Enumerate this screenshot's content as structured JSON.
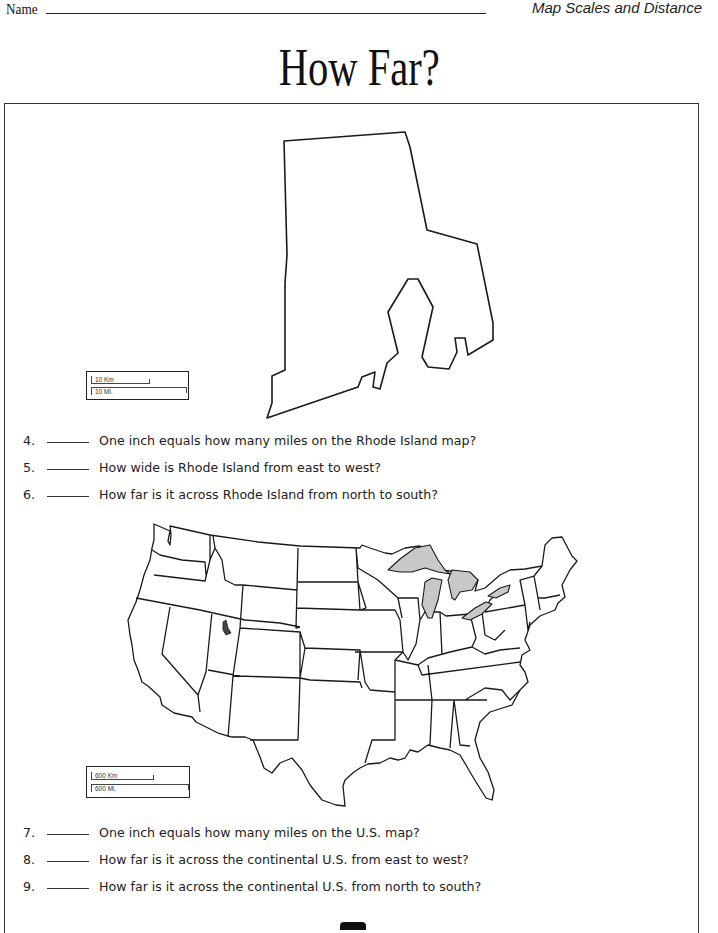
{
  "header": {
    "name_label": "Name",
    "topic": "Map Scales and Distance"
  },
  "title": "How Far?",
  "rhode_island_map": {
    "scale": {
      "km_label": "10 Km",
      "mi_label": "10 Mi."
    }
  },
  "us_map": {
    "scale": {
      "km_label": "600 Km",
      "mi_label": "600 Mi."
    },
    "colors": {
      "land": "#ffffff",
      "outline": "#1a1a1a",
      "lakes": "#c8c8c8"
    }
  },
  "questions": [
    {
      "number": "4.",
      "text": "One inch equals how many miles on the Rhode Island map?"
    },
    {
      "number": "5.",
      "text": "How wide is Rhode Island from east to west?"
    },
    {
      "number": "6.",
      "text": "How far is it across Rhode Island from north to south?"
    },
    {
      "number": "7.",
      "text": "One inch equals how many miles on the U.S. map?"
    },
    {
      "number": "8.",
      "text": "How far is it across the continental U.S. from east to west?"
    },
    {
      "number": "9.",
      "text": "How far is it across the continental U.S. from north to south?"
    }
  ]
}
